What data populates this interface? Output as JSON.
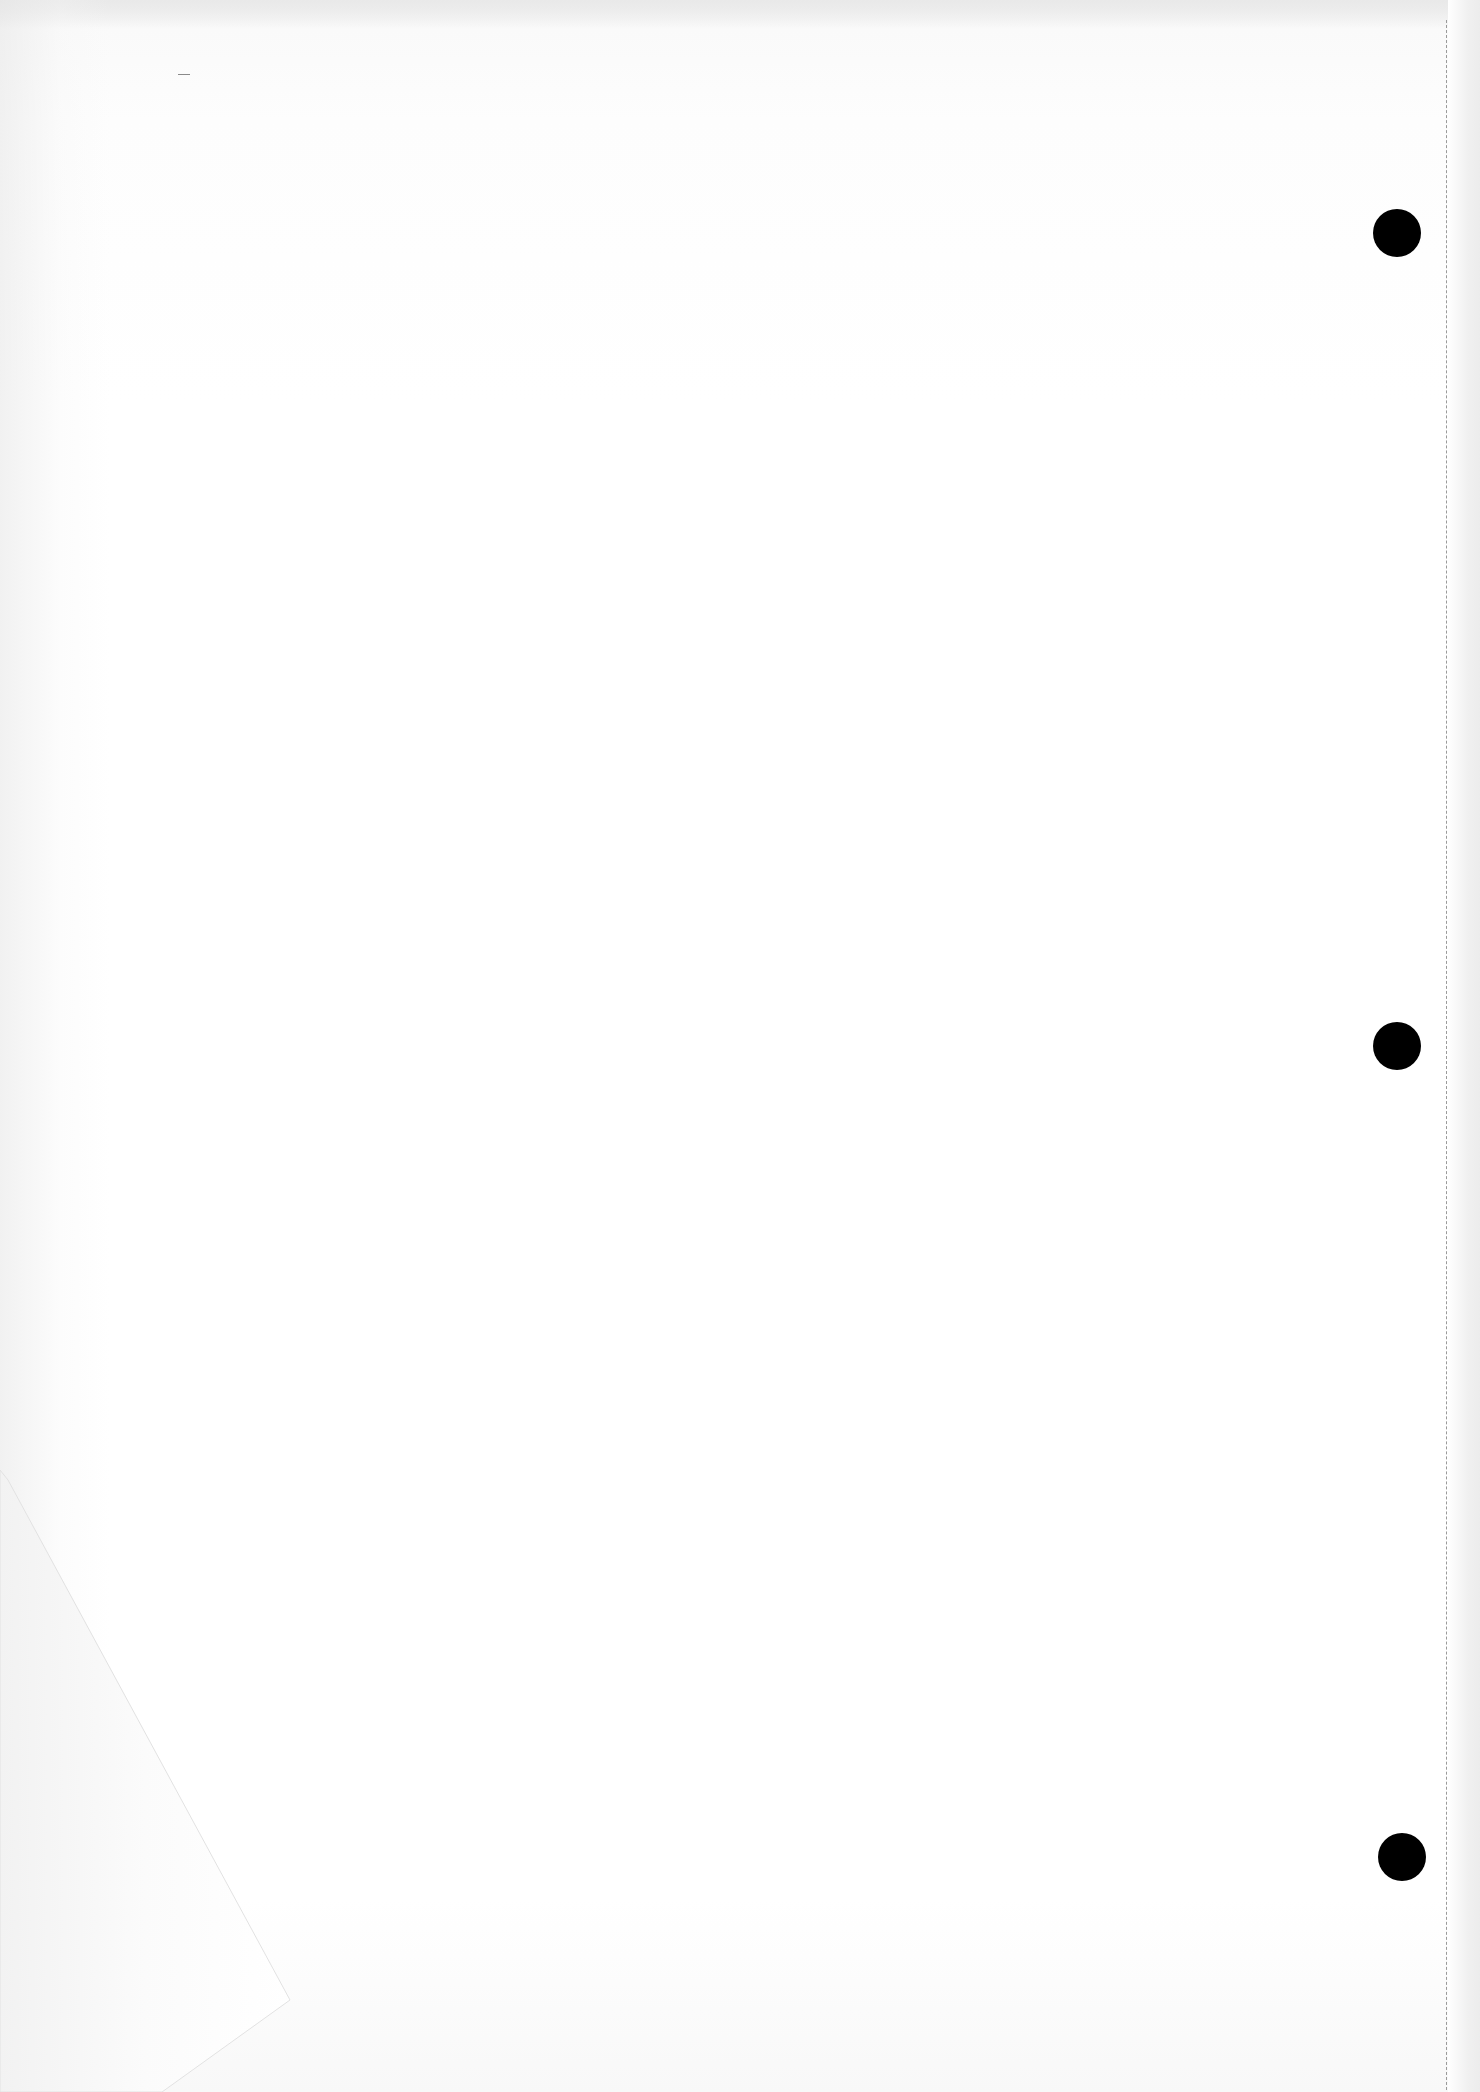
{
  "document": {
    "type": "blank scanned page",
    "text": "",
    "background_color": "#ffffff",
    "hole_color": "#000000",
    "perforation_color": "#9a9a9a"
  },
  "punch_holes": [
    {
      "cx": 1397,
      "cy": 233,
      "r": 24
    },
    {
      "cx": 1397,
      "cy": 1046,
      "r": 24
    },
    {
      "cx": 1402,
      "cy": 1857,
      "r": 24
    }
  ],
  "folded_corner": {
    "position": "bottom-left",
    "points": "8,1480 290,2000 162,2092 0,2092 0,1470"
  }
}
